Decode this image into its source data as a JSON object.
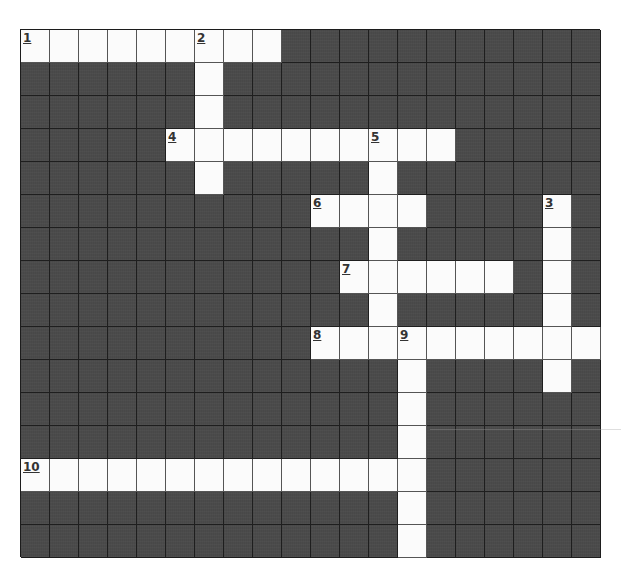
{
  "puzzle": {
    "type": "crossword",
    "cols": 20,
    "rows": 16,
    "colors": {
      "open_cell": "#fbfbfb",
      "block_cell": "#4b4b4b",
      "grid_line": "#1c1c1c",
      "number_text": "#333333"
    },
    "entries": [
      {
        "number": "1",
        "direction": "across",
        "row": 0,
        "col": 0,
        "length": 9
      },
      {
        "number": "2",
        "direction": "down",
        "row": 0,
        "col": 6,
        "length": 5
      },
      {
        "number": "3",
        "direction": "down",
        "row": 5,
        "col": 18,
        "length": 6
      },
      {
        "number": "4",
        "direction": "across",
        "row": 3,
        "col": 5,
        "length": 10
      },
      {
        "number": "5",
        "direction": "down",
        "row": 3,
        "col": 12,
        "length": 7
      },
      {
        "number": "6",
        "direction": "across",
        "row": 5,
        "col": 10,
        "length": 4
      },
      {
        "number": "7",
        "direction": "across",
        "row": 7,
        "col": 11,
        "length": 6
      },
      {
        "number": "8",
        "direction": "across",
        "row": 9,
        "col": 10,
        "length": 10
      },
      {
        "number": "9",
        "direction": "down",
        "row": 9,
        "col": 13,
        "length": 7
      },
      {
        "number": "10",
        "direction": "across",
        "row": 13,
        "col": 0,
        "length": 14
      }
    ]
  }
}
